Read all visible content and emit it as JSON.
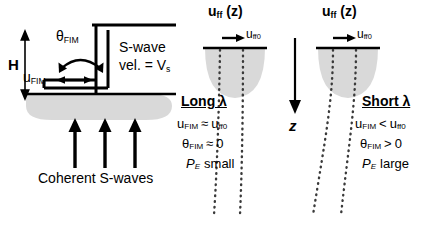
{
  "figure": {
    "type": "schematic-diagram",
    "background": "#ffffff",
    "ink_color": "#000000",
    "soil_fill": "#d9d9d9"
  },
  "left_panel": {
    "height_label": "H",
    "rotation_label_base": "θ",
    "rotation_label_sub": "FIM",
    "translation_label_base": "u",
    "translation_label_sub": "FIM",
    "soil_line1": "S-wave",
    "soil_line2_pre": "vel. = V",
    "soil_line2_sub": "s",
    "incident_waves_label": "Coherent S-waves",
    "wave_arrow_count": 3
  },
  "axis": {
    "label": "z",
    "direction": "downward"
  },
  "middle_panel": {
    "header_base": "u",
    "header_sub": "ff",
    "header_tail": " (z)",
    "surface_arrow_base": "u",
    "surface_arrow_sub": "ff0",
    "case_title": "Long λ",
    "line1": "u FIM ≈ u ff0",
    "line1_parts": {
      "a_base": "u",
      "a_sub": "FIM",
      "op": "≈",
      "b_base": "u",
      "b_sub": "ff0"
    },
    "line2_parts": {
      "a_base": "θ",
      "a_sub": "FIM",
      "op": "≈",
      "b": "0"
    },
    "line3_parts": {
      "a_base": "P",
      "a_sub": "E",
      "b": "small"
    },
    "dotted_profile": "near-vertical (coherent, little variation with depth)"
  },
  "right_panel": {
    "header_base": "u",
    "header_sub": "ff",
    "header_tail": " (z)",
    "surface_arrow_base": "u",
    "surface_arrow_sub": "ff0",
    "case_title": "Short λ",
    "line1_parts": {
      "a_base": "u",
      "a_sub": "FIM",
      "op": "<",
      "b_base": "u",
      "b_sub": "ff0"
    },
    "line2_parts": {
      "a_base": "θ",
      "a_sub": "FIM",
      "op": ">",
      "b": "0"
    },
    "line3_parts": {
      "a_base": "P",
      "a_sub": "E",
      "b": "large"
    },
    "dotted_profile": "diverging / curved (incoherent, strong variation with depth)"
  }
}
